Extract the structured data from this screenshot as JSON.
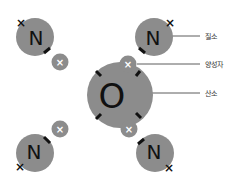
{
  "colors": {
    "atom_fill": "#8c8c8c",
    "proton_fill": "#8c8c8c",
    "proton_mark": "#ffffff",
    "bond_mark": "#111111",
    "leader_line": "#333333",
    "letter": "#111111"
  },
  "center_atom": {
    "symbol": "O"
  },
  "outer_atoms": [
    {
      "id": "top-left",
      "symbol": "N"
    },
    {
      "id": "top-right",
      "symbol": "N"
    },
    {
      "id": "bottom-left",
      "symbol": "N"
    },
    {
      "id": "bottom-right",
      "symbol": "N"
    }
  ],
  "proton_symbol": "×",
  "electron_symbol": "×",
  "labels": {
    "nitrogen": "질소",
    "proton": "양성자",
    "oxygen": "산소"
  }
}
